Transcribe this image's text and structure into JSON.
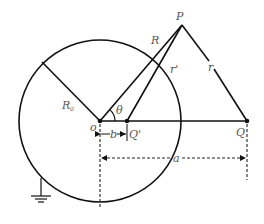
{
  "diagram": {
    "labels": {
      "P": "P",
      "R": "R",
      "r_prime": "r'",
      "r": "r",
      "R0_main": "R",
      "R0_sub": "0",
      "theta": "θ",
      "o": "o",
      "b": "b",
      "Q_prime": "Q'",
      "Q": "Q",
      "a": "a"
    },
    "colors": {
      "line": "#111111",
      "label": "#555555"
    }
  }
}
